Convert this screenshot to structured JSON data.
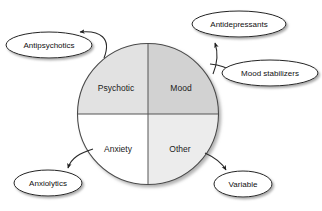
{
  "diagram": {
    "type": "quadrant-circle-with-callouts",
    "colors": {
      "background": "#ffffff",
      "quadrant_psychotic": "#e2e2e2",
      "quadrant_mood": "#d2d2d2",
      "quadrant_anxiety": "#ffffff",
      "quadrant_other": "#ececec",
      "outline": "#4a4a4a",
      "divider": "#555555",
      "callout_fill": "#ffffff",
      "callout_stroke": "#222222",
      "text": "#1b1b1b",
      "shadow": "#b5b5b5"
    },
    "circle": {
      "cx": 148,
      "cy": 114,
      "r": 70.5
    },
    "quadrants": [
      {
        "id": "psychotic",
        "label": "Psychotic",
        "position": "top-left",
        "fill": "#e2e2e2",
        "label_x": 116,
        "label_y": 89
      },
      {
        "id": "mood",
        "label": "Mood",
        "position": "top-right",
        "fill": "#d2d2d2",
        "label_x": 181,
        "label_y": 89
      },
      {
        "id": "anxiety",
        "label": "Anxiety",
        "position": "bottom-left",
        "fill": "#ffffff",
        "label_x": 118,
        "label_y": 150
      },
      {
        "id": "other",
        "label": "Other",
        "position": "bottom-right",
        "fill": "#ececec",
        "label_x": 180,
        "label_y": 150
      }
    ],
    "callouts": [
      {
        "id": "antipsychotics",
        "label": "Antipsychotics",
        "cx": 49,
        "cy": 45,
        "rx": 43,
        "ry": 13,
        "source_quadrant": "psychotic"
      },
      {
        "id": "antidepressants",
        "label": "Antidepressants",
        "cx": 239,
        "cy": 24,
        "rx": 47,
        "ry": 13,
        "source_quadrant": "mood"
      },
      {
        "id": "mood-stabilizers",
        "label": "Mood stabilizers",
        "cx": 270,
        "cy": 73,
        "rx": 48,
        "ry": 13,
        "source_quadrant": "mood"
      },
      {
        "id": "anxiolytics",
        "label": "Anxiolytics",
        "cx": 48,
        "cy": 183,
        "rx": 34,
        "ry": 13,
        "source_quadrant": "anxiety"
      },
      {
        "id": "variable",
        "label": "Variable",
        "cx": 243,
        "cy": 184,
        "rx": 29,
        "ry": 13,
        "source_quadrant": "other"
      }
    ],
    "connectors": [
      {
        "id": "psychotic-to-antipsychotics",
        "from": "psychotic",
        "to": "antipsychotics",
        "path": "M 104 58 C 112 38 100 30 79 32",
        "arrow_at": "antipsychotics"
      },
      {
        "id": "mood-to-antidepressants",
        "from": "mood",
        "to": "antidepressants",
        "path": "M 211 72 C 216 60 217 52 215 43",
        "arrow_at": "antidepressants"
      },
      {
        "id": "mood-to-mood-stabilizers",
        "from": "mood",
        "to": "mood-stabilizers",
        "path": "M 209 63 C 220 65 228 69 233 72",
        "arrow_at": "mood-stabilizers"
      },
      {
        "id": "anxiety-to-anxiolytics",
        "from": "anxiety",
        "to": "anxiolytics",
        "path": "M 93 149 C 80 153 72 158 69 168",
        "arrow_at": "anxiolytics"
      },
      {
        "id": "other-to-variable",
        "from": "other",
        "to": "variable",
        "path": "M 205 153 C 216 158 222 163 226 171",
        "arrow_at": "variable"
      }
    ]
  }
}
